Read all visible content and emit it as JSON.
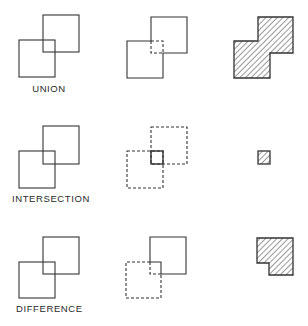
{
  "diagram": {
    "stroke_color": "#333333",
    "hatch_color": "#444444",
    "rows": [
      {
        "id": "union",
        "label": "UNION",
        "left": {
          "description": "two overlapping squares, solid outlines"
        },
        "middle": {
          "description": "outer boundary solid, interior overlap edges dashed"
        },
        "right": {
          "description": "hatched union region (stepped outline)"
        }
      },
      {
        "id": "intersection",
        "label": "INTERSECTION",
        "left": {
          "description": "two overlapping squares, solid outlines"
        },
        "middle": {
          "description": "both squares dashed, overlap square solid"
        },
        "right": {
          "description": "small hatched overlap square"
        }
      },
      {
        "id": "difference",
        "label": "DIFFERENCE",
        "left": {
          "description": "two overlapping squares, solid outlines"
        },
        "middle": {
          "description": "upper-right square solid minus overlap, lower-left square dashed"
        },
        "right": {
          "description": "hatched notched square (upper-right minus lower-left)"
        }
      }
    ]
  }
}
